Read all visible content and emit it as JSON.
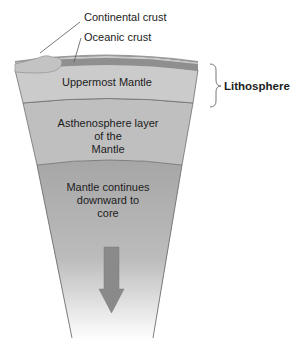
{
  "diagram": {
    "labels": {
      "continental_crust": "Continental crust",
      "oceanic_crust": "Oceanic crust",
      "uppermost_mantle": "Uppermost Mantle",
      "asthenosphere_line1": "Asthenosphere layer",
      "asthenosphere_line2": "of the",
      "asthenosphere_line3": "Mantle",
      "deep_mantle_line1": "Mantle continues",
      "deep_mantle_line2": "downward to",
      "deep_mantle_line3": "core",
      "lithosphere": "Lithosphere"
    },
    "colors": {
      "uppermost_mantle": "#c9c9c9",
      "asthenosphere": "#bdbdbd",
      "deep_mantle_top": "#a9a9a9",
      "deep_mantle_bottom": "#ffffff",
      "oceanic_crust": "#8f8f8f",
      "continental_crust": "#c2c2c2",
      "arrow": "#8a8a8a",
      "outline": "#6e6e6e"
    },
    "icons": {
      "arrow": "down-arrow-icon",
      "brace": "right-curly-brace-icon"
    }
  }
}
